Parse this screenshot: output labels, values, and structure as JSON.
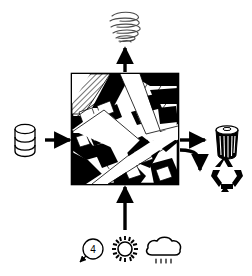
{
  "diagram": {
    "center": {
      "name": "city-block-map",
      "description": "Urban street block plan with black building footprints, white street corridors and a hatched parcel in the upper-left corner",
      "border_color": "#000000",
      "fill_color": "#ffffff",
      "building_color": "#000000",
      "street_color": "#ffffff",
      "hatch_label": "hatched-parcel"
    },
    "inputs": [
      {
        "id": "resource-input",
        "icon": "barrel-cylinder-icon",
        "label": "",
        "position": "left",
        "arrow": "arrow-right"
      },
      {
        "id": "climate-input",
        "position": "bottom",
        "arrow": "arrow-up",
        "icons": [
          {
            "id": "wind-indicator-icon",
            "label": "4",
            "glyph": "circled-number-with-arrow"
          },
          {
            "id": "sun-icon",
            "label": "",
            "glyph": "sun-with-rays"
          },
          {
            "id": "rain-cloud-icon",
            "label": "",
            "glyph": "cloud-with-raindrops"
          }
        ]
      }
    ],
    "outputs": [
      {
        "id": "emissions-output",
        "icon": "smoke-spiral-icon",
        "label": "",
        "position": "top",
        "arrow": "arrow-up"
      },
      {
        "id": "waste-output",
        "icon": "trash-bin-icon",
        "label": "",
        "position": "right",
        "arrow": "arrow-right"
      },
      {
        "id": "recycling-output",
        "icon": "recycling-symbol-icon",
        "label": "",
        "position": "right-lower",
        "arrow": "curved-arrow-down-right"
      }
    ],
    "colors": {
      "ink": "#000000",
      "paper": "#ffffff",
      "smoke": "#555555"
    }
  }
}
